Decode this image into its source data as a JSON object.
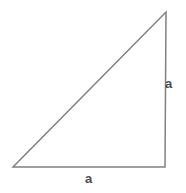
{
  "figure": {
    "name": "right-triangle-with-equal-legs",
    "background_color": "#ffffff",
    "width": 186,
    "height": 193,
    "stroke_color": "#808080",
    "stroke_width": 1.5,
    "fill": "none",
    "label_color": "#4d4d4d",
    "label_font_size": 13
  },
  "chart_data": {
    "type": "diagram",
    "title": "",
    "subtitle": "",
    "xlabel": "",
    "ylabel": "",
    "shape": "right triangle",
    "fill": "none",
    "stroke": "#808080",
    "vertices": [
      {
        "name": "bottom-left",
        "x": 13,
        "y": 167
      },
      {
        "name": "bottom-right",
        "x": 165,
        "y": 167
      },
      {
        "name": "top-right",
        "x": 166,
        "y": 12
      }
    ],
    "edges": [
      {
        "name": "bottom-leg",
        "from": "bottom-left",
        "to": "bottom-right",
        "label": "a"
      },
      {
        "name": "right-leg",
        "from": "bottom-right",
        "to": "top-right",
        "label": "a"
      },
      {
        "name": "hypotenuse",
        "from": "top-right",
        "to": "bottom-left",
        "label": ""
      }
    ],
    "annotations": [
      {
        "name": "right-leg-label",
        "text": "a",
        "x": 170,
        "y": 84
      },
      {
        "name": "bottom-leg-label",
        "text": "a",
        "x": 89,
        "y": 178
      }
    ],
    "legend": [],
    "grid": false
  },
  "labels": {
    "right_leg": "a",
    "bottom_leg": "a"
  }
}
